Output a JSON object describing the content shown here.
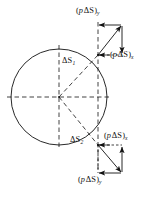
{
  "figure": {
    "colors": {
      "stroke": "#111111",
      "background": "#ffffff"
    },
    "geometry": {
      "circle": {
        "cx": 59,
        "cy": 97,
        "r": 48
      },
      "chord_x": 98,
      "upper_point": {
        "x": 98,
        "y": 55
      },
      "lower_point": {
        "x": 98,
        "y": 145
      },
      "upper_vector_tip": {
        "x": 122,
        "y": 25
      },
      "lower_vector_tip": {
        "x": 122,
        "y": 170
      }
    },
    "labels": {
      "delta_s_upper": {
        "symbol": "ΔS",
        "subscript": "1"
      },
      "delta_s_lower": {
        "symbol": "ΔS",
        "subscript": "2"
      },
      "top_y": {
        "open": "(",
        "p": "p",
        "ds": "ΔS",
        "close": ")",
        "subscript": "y"
      },
      "top_x": {
        "open": "(",
        "p": "p",
        "ds": "ΔS",
        "close": ")",
        "subscript": "x"
      },
      "bottom_x": {
        "open": "(",
        "p": "p",
        "ds": "ΔS",
        "close": ")",
        "subscript": "x"
      },
      "bottom_y": {
        "open": "(",
        "p": "p",
        "ds": "ΔS",
        "close": ")",
        "subscript": "y"
      }
    }
  }
}
